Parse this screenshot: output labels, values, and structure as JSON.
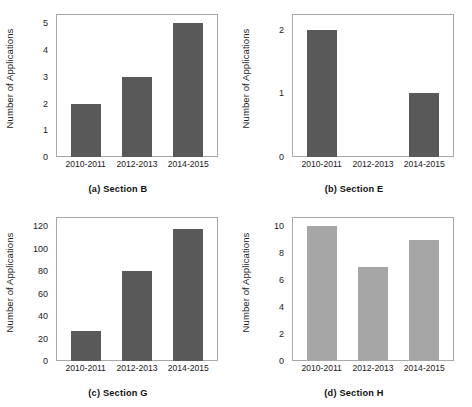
{
  "figure": {
    "layout": "2x2 grid of bar charts",
    "panel_count": 4
  },
  "chart_data": [
    {
      "type": "bar",
      "panel": "a",
      "title": "(a)  Section B",
      "caption": "(a)  Section B",
      "xlabel": "",
      "ylabel": "Number of Applications",
      "categories": [
        "2010-2011",
        "2012-2013",
        "2014-2015"
      ],
      "values": [
        2,
        3,
        5
      ],
      "yticks": [
        0,
        1,
        2,
        3,
        4,
        5
      ],
      "ylim": [
        0,
        5.35
      ],
      "grid": false,
      "legend": "none",
      "bar_color": "#595959"
    },
    {
      "type": "bar",
      "panel": "b",
      "title": "(b)  Section E",
      "caption": "(b)  Section E",
      "xlabel": "",
      "ylabel": "Number of Applications",
      "categories": [
        "2010-2011",
        "2012-2013",
        "2014-2015"
      ],
      "values": [
        2,
        0,
        1
      ],
      "yticks": [
        0,
        1,
        2
      ],
      "ylim": [
        0,
        2.25
      ],
      "grid": false,
      "legend": "none",
      "bar_color": "#595959"
    },
    {
      "type": "bar",
      "panel": "c",
      "title": "(c)  Section G",
      "caption": "(c)  Section G",
      "xlabel": "",
      "ylabel": "Number of Applications",
      "categories": [
        "2010-2011",
        "2012-2013",
        "2014-2015"
      ],
      "values": [
        27,
        80,
        117
      ],
      "yticks": [
        0,
        20,
        40,
        60,
        80,
        100,
        120
      ],
      "ylim": [
        0,
        128
      ],
      "grid": false,
      "legend": "none",
      "bar_color": "#595959"
    },
    {
      "type": "bar",
      "panel": "d",
      "title": "(d)  Section H",
      "caption": "(d)  Section H",
      "xlabel": "",
      "ylabel": "Number of Applications",
      "categories": [
        "2010-2011",
        "2012-2013",
        "2014-2015"
      ],
      "values": [
        10,
        7,
        9
      ],
      "yticks": [
        0,
        2,
        4,
        6,
        8,
        10
      ],
      "ylim": [
        0,
        10.7
      ],
      "grid": false,
      "legend": "none",
      "bar_color": "#a6a6a6"
    }
  ]
}
